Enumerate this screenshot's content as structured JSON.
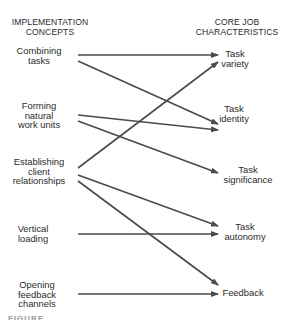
{
  "headers": {
    "left": "IMPLEMENTATION\nCONCEPTS",
    "right": "CORE JOB\nCHARACTERISTICS"
  },
  "implementation_concepts": [
    {
      "id": "combining",
      "label": "Combining\ntasks"
    },
    {
      "id": "forming",
      "label": "Forming\nnatural\nwork units"
    },
    {
      "id": "establishing",
      "label": "Establishing\nclient\nrelationships"
    },
    {
      "id": "vertical",
      "label": "Vertical\nloading"
    },
    {
      "id": "opening",
      "label": "Opening\nfeedback\nchannels"
    }
  ],
  "core_job_characteristics": [
    {
      "id": "variety",
      "label": "Task\nvariety"
    },
    {
      "id": "identity",
      "label": "Task\nidentity"
    },
    {
      "id": "significance",
      "label": "Task\nsignificance"
    },
    {
      "id": "autonomy",
      "label": "Task\nautonomy"
    },
    {
      "id": "feedback",
      "label": "Feedback"
    }
  ],
  "connections": [
    {
      "from": "Combining tasks",
      "to": "Task variety"
    },
    {
      "from": "Combining tasks",
      "to": "Task identity"
    },
    {
      "from": "Forming natural work units",
      "to": "Task identity"
    },
    {
      "from": "Forming natural work units",
      "to": "Task significance"
    },
    {
      "from": "Establishing client relationships",
      "to": "Task variety"
    },
    {
      "from": "Establishing client relationships",
      "to": "Task autonomy"
    },
    {
      "from": "Establishing client relationships",
      "to": "Feedback"
    },
    {
      "from": "Vertical loading",
      "to": "Task autonomy"
    },
    {
      "from": "Opening feedback channels",
      "to": "Feedback"
    }
  ],
  "caption_partial": "FIGURE",
  "colors": {
    "line": "#4a4a4a",
    "text": "#2b2b2b",
    "background": "#ffffff"
  }
}
